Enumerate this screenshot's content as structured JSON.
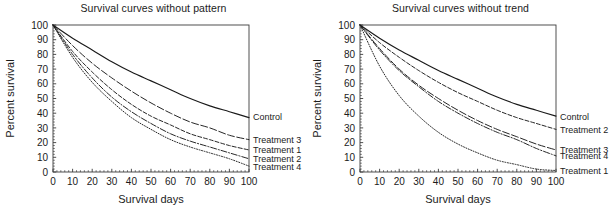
{
  "figure": {
    "background_color": "#ffffff",
    "line_color": "#1a1a1a",
    "axis_color": "#3c3c3c"
  },
  "panels": [
    {
      "id": "left",
      "title": "Survival curves without pattern",
      "xlabel": "Survival days",
      "ylabel": "Percent survival",
      "series_labels": [
        "Control",
        "Treatment 3",
        "Treatment 1",
        "Treatment 2",
        "Treatment 4"
      ]
    },
    {
      "id": "right",
      "title": "Survival curves without trend",
      "xlabel": "Survival days",
      "ylabel": "Percent survival",
      "series_labels": [
        "Control",
        "Treatment 2",
        "Treatment 3",
        "Treatment 4",
        "Treatment 1"
      ]
    }
  ],
  "chart_data": [
    {
      "type": "line",
      "title": "Survival curves without pattern",
      "xlabel": "Survival days",
      "ylabel": "Percent survival",
      "xlim": [
        0,
        100
      ],
      "ylim": [
        0,
        100
      ],
      "xticks": [
        0,
        10,
        20,
        30,
        40,
        50,
        60,
        70,
        80,
        90,
        100
      ],
      "yticks": [
        0,
        10,
        20,
        30,
        40,
        50,
        60,
        70,
        80,
        90,
        100
      ],
      "grid": false,
      "legend": "inline-right-of-curve-ends",
      "x": [
        0,
        10,
        20,
        30,
        40,
        50,
        60,
        70,
        80,
        90,
        100
      ],
      "series": [
        {
          "name": "Control",
          "style": "solid",
          "label_x": 100,
          "label_y": 38,
          "values": [
            100,
            91,
            83,
            75,
            68,
            62,
            56,
            50,
            45,
            41,
            37
          ]
        },
        {
          "name": "Treatment 3",
          "style": "long-dash",
          "label_x": 100,
          "label_y": 22,
          "values": [
            100,
            86,
            74,
            64,
            55,
            47,
            40,
            34,
            30,
            25,
            22
          ]
        },
        {
          "name": "Treatment 1",
          "style": "dash",
          "label_x": 100,
          "label_y": 15,
          "values": [
            100,
            82,
            68,
            56,
            46,
            38,
            32,
            26,
            22,
            18,
            15
          ]
        },
        {
          "name": "Treatment 2",
          "style": "dash-dot",
          "label_x": 100,
          "label_y": 9,
          "values": [
            100,
            80,
            64,
            51,
            41,
            33,
            26,
            21,
            17,
            13,
            9
          ]
        },
        {
          "name": "Treatment 4",
          "style": "dotted",
          "label_x": 100,
          "label_y": 4,
          "values": [
            100,
            78,
            61,
            48,
            37,
            29,
            22,
            17,
            13,
            9,
            4
          ]
        }
      ]
    },
    {
      "type": "line",
      "title": "Survival curves without trend",
      "xlabel": "Survival days",
      "ylabel": "Percent survival",
      "xlim": [
        0,
        100
      ],
      "ylim": [
        0,
        100
      ],
      "xticks": [
        0,
        10,
        20,
        30,
        40,
        50,
        60,
        70,
        80,
        90,
        100
      ],
      "yticks": [
        0,
        10,
        20,
        30,
        40,
        50,
        60,
        70,
        80,
        90,
        100
      ],
      "grid": false,
      "legend": "inline-right-of-curve-ends",
      "x": [
        0,
        10,
        20,
        30,
        40,
        50,
        60,
        70,
        80,
        90,
        100
      ],
      "series": [
        {
          "name": "Control",
          "style": "solid",
          "label_x": 100,
          "label_y": 38,
          "values": [
            100,
            91,
            83,
            76,
            69,
            63,
            57,
            51,
            46,
            42,
            38
          ]
        },
        {
          "name": "Treatment 2",
          "style": "dash",
          "label_x": 100,
          "label_y": 29,
          "values": [
            100,
            88,
            78,
            69,
            61,
            54,
            48,
            42,
            37,
            33,
            29
          ]
        },
        {
          "name": "Treatment 3",
          "style": "long-dash",
          "label_x": 100,
          "label_y": 15,
          "values": [
            100,
            84,
            70,
            59,
            50,
            42,
            35,
            29,
            24,
            19,
            15
          ]
        },
        {
          "name": "Treatment 4",
          "style": "dash-dot",
          "label_x": 100,
          "label_y": 11,
          "values": [
            100,
            83,
            69,
            58,
            48,
            40,
            33,
            27,
            22,
            16,
            11
          ]
        },
        {
          "name": "Treatment 1",
          "style": "dotted",
          "label_x": 100,
          "label_y": 1,
          "values": [
            100,
            72,
            52,
            38,
            27,
            19,
            13,
            8,
            5,
            2,
            1
          ]
        }
      ]
    }
  ]
}
